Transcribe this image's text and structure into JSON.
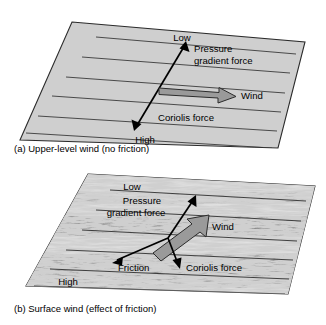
{
  "figure": {
    "colors": {
      "plane_fill_a": "#cfcfcf",
      "plane_stroke": "#2b2b2b",
      "isobar_stroke": "#333333",
      "wind_arrow_fill": "#9a9a9a",
      "wind_arrow_stroke": "#2b2b2b",
      "force_arrow": "#000000",
      "background": "#ffffff",
      "terrain_light": "#cdcdcd",
      "terrain_dark": "#3a3a3a"
    }
  },
  "panel_a": {
    "caption": "(a) Upper-level wind (no friction)",
    "isobar_count": 6,
    "labels": {
      "low": "Low",
      "high": "High",
      "pressure_gradient_line1": "Pressure",
      "pressure_gradient_line2": "gradient force",
      "wind": "Wind",
      "coriolis": "Coriolis force"
    },
    "arrows": [
      {
        "name": "pressure-gradient-coriolis-axis",
        "style": "double-headed-black-line",
        "from": "High",
        "to": "Low"
      },
      {
        "name": "wind-arrow",
        "style": "gray-block-arrow",
        "direction": "right"
      }
    ]
  },
  "panel_b": {
    "caption": "(b) Surface wind (effect of friction)",
    "isobar_count": 6,
    "labels": {
      "low": "Low",
      "high": "High",
      "pressure_gradient_line1": "Pressure",
      "pressure_gradient_line2": "gradient force",
      "wind": "Wind",
      "coriolis": "Coriolis force",
      "friction": "Friction"
    },
    "arrows": [
      {
        "name": "pressure-gradient-force-arrow",
        "style": "black-arrow",
        "direction": "up-right"
      },
      {
        "name": "friction-arrow",
        "style": "black-arrow",
        "direction": "down-left"
      },
      {
        "name": "coriolis-force-arrow",
        "style": "black-arrow",
        "direction": "down"
      },
      {
        "name": "wind-arrow",
        "style": "gray-block-arrow",
        "direction": "up-right"
      }
    ]
  }
}
